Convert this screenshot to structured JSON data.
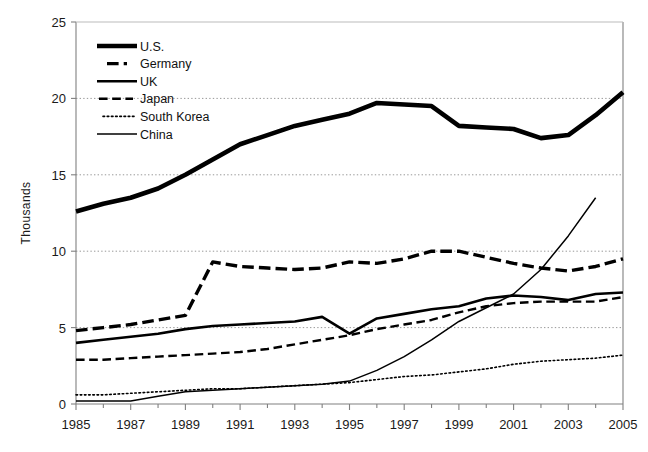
{
  "chart_data": {
    "type": "line",
    "title": "",
    "xlabel": "",
    "ylabel": "Thousands",
    "xlim": [
      1985,
      2005
    ],
    "ylim": [
      0,
      25
    ],
    "ytick_values": [
      0,
      5,
      10,
      15,
      20,
      25
    ],
    "ytick_labels": [
      "0",
      "5",
      "10",
      "15",
      "20",
      "25"
    ],
    "xtick_values": [
      1985,
      1987,
      1989,
      1991,
      1993,
      1995,
      1997,
      1999,
      2001,
      2003,
      2005
    ],
    "xtick_labels": [
      "1985",
      "1987",
      "1989",
      "1991",
      "1993",
      "1995",
      "1997",
      "1999",
      "2001",
      "2003",
      "2005"
    ],
    "grid": "horizontal-dotted",
    "legend_position": "upper-left-inside",
    "x": [
      1985,
      1986,
      1987,
      1988,
      1989,
      1990,
      1991,
      1992,
      1993,
      1994,
      1995,
      1996,
      1997,
      1998,
      1999,
      2000,
      2001,
      2002,
      2003,
      2004,
      2005
    ],
    "series": [
      {
        "name": "U.S.",
        "style": "solid",
        "width": 4.6,
        "color": "#000000",
        "values": [
          12.6,
          13.1,
          13.5,
          14.1,
          15.0,
          16.0,
          17.0,
          17.6,
          18.2,
          18.6,
          19.0,
          19.7,
          19.6,
          19.5,
          18.2,
          18.1,
          18.0,
          17.4,
          17.6,
          18.9,
          20.4
        ]
      },
      {
        "name": "Germany",
        "style": "dashed-heavy",
        "width": 3.4,
        "color": "#000000",
        "values": [
          4.8,
          5.0,
          5.2,
          5.5,
          5.8,
          9.3,
          9.0,
          8.9,
          8.8,
          8.9,
          9.3,
          9.2,
          9.5,
          10.0,
          10.0,
          9.6,
          9.2,
          8.9,
          8.7,
          9.0,
          9.5
        ]
      },
      {
        "name": "UK",
        "style": "solid",
        "width": 2.6,
        "color": "#000000",
        "values": [
          4.0,
          4.2,
          4.4,
          4.6,
          4.9,
          5.1,
          5.2,
          5.3,
          5.4,
          5.7,
          4.6,
          5.6,
          5.9,
          6.2,
          6.4,
          6.9,
          7.1,
          7.0,
          6.8,
          7.2,
          7.3
        ]
      },
      {
        "name": "Japan",
        "style": "dashed-light",
        "width": 2.4,
        "color": "#000000",
        "values": [
          2.9,
          2.9,
          3.0,
          3.1,
          3.2,
          3.3,
          3.4,
          3.6,
          3.9,
          4.2,
          4.5,
          4.9,
          5.2,
          5.5,
          6.0,
          6.4,
          6.6,
          6.7,
          6.7,
          6.7,
          7.0
        ]
      },
      {
        "name": "South Korea",
        "style": "dotted",
        "width": 1.6,
        "color": "#000000",
        "values": [
          0.6,
          0.6,
          0.7,
          0.8,
          0.9,
          1.0,
          1.0,
          1.1,
          1.2,
          1.3,
          1.4,
          1.6,
          1.8,
          1.9,
          2.1,
          2.3,
          2.6,
          2.8,
          2.9,
          3.0,
          3.2
        ]
      },
      {
        "name": "China",
        "style": "solid",
        "width": 1.5,
        "color": "#000000",
        "values": [
          0.2,
          0.2,
          0.2,
          0.5,
          0.8,
          0.9,
          1.0,
          1.1,
          1.2,
          1.3,
          1.5,
          2.2,
          3.1,
          4.2,
          5.4,
          6.3,
          7.2,
          8.8,
          11.0,
          13.5,
          null
        ]
      }
    ]
  },
  "legend": {
    "entries": [
      {
        "label": "U.S."
      },
      {
        "label": "Germany"
      },
      {
        "label": "UK"
      },
      {
        "label": "Japan"
      },
      {
        "label": "South Korea"
      },
      {
        "label": "China"
      }
    ]
  }
}
